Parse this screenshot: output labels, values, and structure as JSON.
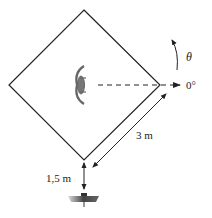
{
  "diagram": {
    "labels": {
      "angle_symbol": "θ",
      "zero_angle": "0°",
      "side_length": "3 m",
      "distance_below": "1,5 m"
    },
    "colors": {
      "line": "#222222",
      "object": "#777777"
    }
  }
}
